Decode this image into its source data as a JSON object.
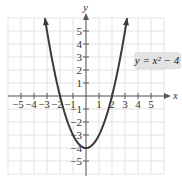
{
  "chart_data": {
    "type": "line",
    "title": "",
    "equation_label": "y = x² − 4",
    "function": "y = x^2 - 4",
    "xlabel": "x",
    "ylabel": "y",
    "xlim": [
      -6,
      6
    ],
    "ylim": [
      -6,
      6
    ],
    "grid": true,
    "x_ticks": [
      -5,
      -4,
      -3,
      -2,
      -1,
      1,
      2,
      3,
      4,
      5
    ],
    "y_ticks": [
      5,
      4,
      3,
      2,
      1,
      -1,
      -2,
      -3,
      -4,
      -5
    ],
    "x_tick_labels": [
      "−5",
      "−4",
      "−3",
      "−2",
      "−1",
      "1",
      "2",
      "3",
      "4",
      "5"
    ],
    "y_tick_labels": [
      "5",
      "4",
      "3",
      "2",
      "1",
      "−1",
      "−2",
      "−3",
      "−4",
      "−5"
    ],
    "series": [
      {
        "name": "y = x² − 4",
        "x": [
          -3.16,
          -3,
          -2.5,
          -2,
          -1.5,
          -1,
          -0.5,
          0,
          0.5,
          1,
          1.5,
          2,
          2.5,
          3,
          3.16
        ],
        "values": [
          6,
          5,
          2.25,
          0,
          -1.75,
          -3,
          -3.75,
          -4,
          -3.75,
          -3,
          -1.75,
          0,
          2.25,
          5,
          6
        ]
      }
    ],
    "key_points": {
      "vertex": [
        0,
        -4
      ],
      "x_intercepts": [
        [
          -2,
          0
        ],
        [
          2,
          0
        ]
      ],
      "y_intercept": [
        0,
        -4
      ]
    },
    "colors": {
      "curve": "#3a3a3a",
      "grid": "#dcdcdc",
      "axis": "#5a5a5a",
      "label_box": "#e3e3e3"
    }
  }
}
